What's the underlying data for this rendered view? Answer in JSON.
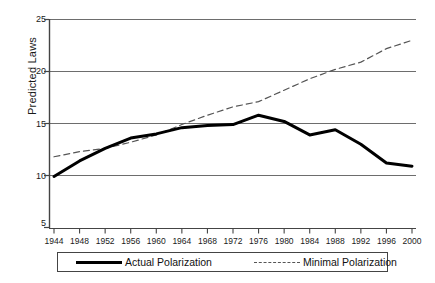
{
  "chart_data": {
    "type": "line",
    "title": "",
    "xlabel": "",
    "ylabel": "Predicted Laws",
    "xlim": [
      1944,
      2000
    ],
    "ylim": [
      5,
      25
    ],
    "yticks": [
      5,
      10,
      15,
      20,
      25
    ],
    "grid": "horizontal",
    "legend_position": "bottom",
    "x": [
      1944,
      1948,
      1952,
      1956,
      1960,
      1964,
      1968,
      1972,
      1976,
      1980,
      1984,
      1988,
      1992,
      1996,
      2000
    ],
    "categories": [
      "1944",
      "1948",
      "1952",
      "1956",
      "1960",
      "1964",
      "1968",
      "1972",
      "1976",
      "1980",
      "1984",
      "1988",
      "1992",
      "1996",
      "2000"
    ],
    "series": [
      {
        "name": "Actual Polarization",
        "style": "solid",
        "color": "#000000",
        "width": 3,
        "values": [
          9.9,
          11.4,
          12.6,
          13.6,
          14.0,
          14.6,
          14.8,
          14.9,
          15.8,
          15.2,
          13.9,
          14.4,
          13.0,
          11.2,
          10.9
        ]
      },
      {
        "name": "Minimal Polarization",
        "style": "dashed",
        "color": "#555555",
        "width": 1.2,
        "values": [
          11.8,
          12.3,
          12.6,
          13.2,
          13.9,
          14.9,
          15.8,
          16.6,
          17.1,
          18.2,
          19.3,
          20.2,
          20.9,
          22.2,
          23.0
        ]
      }
    ]
  },
  "axis": {
    "y_label": "Predicted Laws",
    "y_ticks": [
      "25",
      "20",
      "15",
      "10",
      "5"
    ],
    "x_ticks": [
      "1944",
      "1948",
      "1952",
      "1956",
      "1960",
      "1964",
      "1968",
      "1972",
      "1976",
      "1980",
      "1984",
      "1988",
      "1992",
      "1996",
      "2000"
    ]
  },
  "legend": {
    "items": [
      {
        "label": "Actual Polarization",
        "style": "solid"
      },
      {
        "label": "Minimal Polarization",
        "style": "dashed"
      }
    ]
  }
}
